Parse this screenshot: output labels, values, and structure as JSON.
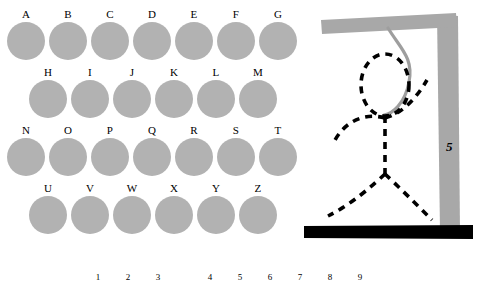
{
  "app": {
    "title": "Hangman"
  },
  "keyboard": {
    "rows": [
      {
        "letters": [
          "A",
          "B",
          "C",
          "D",
          "E",
          "F",
          "G"
        ]
      },
      {
        "letters": [
          "H",
          "I",
          "J",
          "K",
          "L",
          "M"
        ]
      },
      {
        "letters": [
          "N",
          "O",
          "P",
          "Q",
          "R",
          "S",
          "T"
        ]
      },
      {
        "letters": [
          "U",
          "V",
          "W",
          "X",
          "Y",
          "Z"
        ]
      }
    ],
    "key_color": "#b2b2b2",
    "label_color": "#000000"
  },
  "gallows": {
    "post_color": "#a8a8a8",
    "beam_color": "#a8a8a8",
    "base_color": "#000000",
    "rope_color": "#9e9e9e",
    "figure_color": "#000000",
    "parts_drawn": [
      "head",
      "body",
      "left-arm",
      "right-arm",
      "left-leg",
      "right-leg"
    ]
  },
  "counter": {
    "value": "5",
    "color": "#000000"
  },
  "answer": {
    "slots": [
      {
        "index": "1",
        "letter": ""
      },
      {
        "index": "2",
        "letter": ""
      },
      {
        "index": "3",
        "letter": ""
      },
      {
        "gap": true
      },
      {
        "index": "4",
        "letter": ""
      },
      {
        "index": "5",
        "letter": ""
      },
      {
        "index": "6",
        "letter": ""
      },
      {
        "index": "7",
        "letter": ""
      },
      {
        "index": "8",
        "letter": ""
      },
      {
        "index": "9",
        "letter": ""
      }
    ]
  }
}
